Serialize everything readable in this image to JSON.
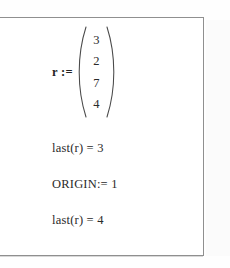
{
  "document": {
    "type": "math-worksheet-excerpt",
    "frame": {
      "border_color": "#8f8f8f",
      "background": "#ffffff"
    },
    "text_color": "#2a2a2a"
  },
  "assignment": {
    "variable_label": "r :=",
    "vector": {
      "orientation": "column",
      "open_paren": "(",
      "close_paren": ")",
      "values": [
        "3",
        "2",
        "7",
        "4"
      ]
    }
  },
  "statements": [
    {
      "text": "last(r) = 3"
    },
    {
      "text": "ORIGIN:= 1"
    },
    {
      "text": "last(r) = 4"
    }
  ]
}
